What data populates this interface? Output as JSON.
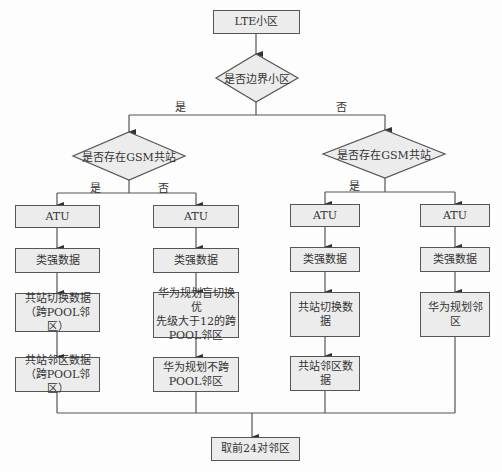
{
  "title_node": "LTE小区",
  "decision_boundary": "是否边界小区",
  "branch_labels": {
    "boundary_yes": "是",
    "boundary_no": "否",
    "left_gsm_yes": "是",
    "left_gsm_no": "否",
    "right_gsm_yes": "是"
  },
  "left_decision": "是否存在GSM共站",
  "right_decision": "是否存在GSM共站",
  "columns": [
    {
      "atu": "ATU",
      "data": "类强数据",
      "step3": "共站切换数据\n（跨POOL邻区）",
      "step4": "共站邻区数据\n（跨POOL邻区）"
    },
    {
      "atu": "ATU",
      "data": "类强数据",
      "step3": "华为规划盲切换优\n先级大于12的跨\nPOOL邻区",
      "step4": "华为规划不跨\nPOOL邻区"
    },
    {
      "atu": "ATU",
      "data": "类强数据",
      "step3": "共站切换数据",
      "step4": "共站邻区数据"
    },
    {
      "atu": "ATU",
      "data": "类强数据",
      "step3": "华为规划邻区"
    }
  ],
  "final_node": "取前24对邻区",
  "colors": {
    "box_fill": "#ececec",
    "stroke": "#555555",
    "text": "#333333"
  }
}
